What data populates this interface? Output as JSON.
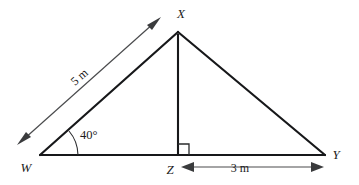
{
  "figure": {
    "type": "geometry-diagram",
    "shape": "triangle-with-altitude",
    "background_color": "#ffffff",
    "line_color": "#17181a",
    "dimension_color": "#4a4b4d"
  },
  "vertices": [
    {
      "id": "W",
      "label": "W",
      "x": 40,
      "y": 155,
      "label_x": 26,
      "label_y": 172
    },
    {
      "id": "X",
      "label": "X",
      "x": 178,
      "y": 32,
      "label_x": 181,
      "label_y": 18
    },
    {
      "id": "Y",
      "label": "Y",
      "x": 325,
      "y": 155,
      "label_x": 333,
      "label_y": 158
    },
    {
      "id": "Z",
      "label": "Z",
      "x": 178,
      "y": 155,
      "label_x": 166,
      "label_y": 174
    }
  ],
  "edges": [
    {
      "id": "WX",
      "from": "W",
      "to": "X"
    },
    {
      "id": "XY",
      "from": "X",
      "to": "Y"
    },
    {
      "id": "WY",
      "from": "W",
      "to": "Y"
    },
    {
      "id": "XZ",
      "from": "X",
      "to": "Z",
      "style": "altitude"
    }
  ],
  "angles": [
    {
      "id": "angle-W",
      "at": "W",
      "label": "40°",
      "value": 40,
      "unit": "degrees",
      "label_x": 78,
      "label_y": 138
    },
    {
      "id": "angle-Z",
      "at": "Z",
      "label": "",
      "value": 90,
      "unit": "degrees",
      "marker": "right-angle-square"
    }
  ],
  "measurements": [
    {
      "id": "measure-WX",
      "label": "5 m",
      "value": 5,
      "unit": "m",
      "applies_to": "WX",
      "arrow_style": "double-headed",
      "label_rotation": -41,
      "label_x": 82,
      "label_y": 80
    },
    {
      "id": "measure-ZY",
      "label": "3 m",
      "value": 3,
      "unit": "m",
      "applies_to": "ZY",
      "arrow_style": "double-headed",
      "label_rotation": 0,
      "label_x": 240,
      "label_y": 172
    }
  ]
}
